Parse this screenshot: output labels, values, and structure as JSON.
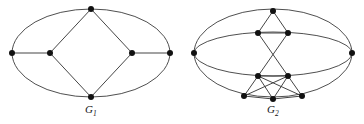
{
  "figure": {
    "background_color": "#ffffff",
    "edge_color": "#3b3b3b",
    "node_color": "#111111",
    "caption_color": "#141414"
  },
  "graphs": [
    {
      "id": "G1",
      "caption_main": "G",
      "caption_sub": "1",
      "caption_full": "G1",
      "node_count": 6,
      "edge_count": 8,
      "outline": {
        "shape": "ellipse",
        "cx": 91,
        "cy": 53,
        "rx": 79,
        "ry": 45
      },
      "nodes": [
        {
          "name": "left-pole",
          "x": 12,
          "y": 53,
          "r": 3.0
        },
        {
          "name": "inner-left",
          "x": 50,
          "y": 53,
          "r": 3.0
        },
        {
          "name": "top",
          "x": 91,
          "y": 9,
          "r": 3.0
        },
        {
          "name": "bottom",
          "x": 91,
          "y": 97,
          "r": 3.0
        },
        {
          "name": "inner-right",
          "x": 132,
          "y": 53,
          "r": 3.0
        },
        {
          "name": "right-pole",
          "x": 170,
          "y": 53,
          "r": 3.0
        }
      ],
      "straight_edges": [
        {
          "from": "left-pole",
          "to": "inner-left"
        },
        {
          "from": "inner-left",
          "to": "top"
        },
        {
          "from": "inner-left",
          "to": "bottom"
        },
        {
          "from": "top",
          "to": "inner-right"
        },
        {
          "from": "bottom",
          "to": "inner-right"
        },
        {
          "from": "inner-right",
          "to": "right-pole"
        }
      ],
      "arc_edges": [
        {
          "from": "left-pole",
          "to": "right-pole",
          "via": "top-arc"
        },
        {
          "from": "left-pole",
          "to": "right-pole",
          "via": "bottom-arc"
        }
      ]
    },
    {
      "id": "G2",
      "caption_main": "G",
      "caption_sub": "2",
      "caption_full": "G2",
      "node_count": 9,
      "edge_count": 18,
      "outline": {
        "shape": "triple-ellipse",
        "cx": 91,
        "cy": 53,
        "rx": 79,
        "ry_outer": 45,
        "ry_middle": 22,
        "ry_inner": 22
      },
      "nodes": [
        {
          "name": "left-pole",
          "x": 12,
          "y": 53,
          "r": 3.0
        },
        {
          "name": "right-pole",
          "x": 170,
          "y": 53,
          "r": 3.0
        },
        {
          "name": "top",
          "x": 91,
          "y": 11,
          "r": 3.0
        },
        {
          "name": "upper-left",
          "x": 76,
          "y": 33,
          "r": 3.0
        },
        {
          "name": "upper-right",
          "x": 106,
          "y": 33,
          "r": 3.0
        },
        {
          "name": "lower-left",
          "x": 76,
          "y": 76,
          "r": 3.0
        },
        {
          "name": "lower-right",
          "x": 106,
          "y": 76,
          "r": 3.0
        },
        {
          "name": "bottom-left",
          "x": 62,
          "y": 96,
          "r": 3.0
        },
        {
          "name": "bottom-center",
          "x": 91,
          "y": 99,
          "r": 3.0
        },
        {
          "name": "bottom-right",
          "x": 120,
          "y": 96,
          "r": 3.0
        }
      ],
      "straight_edges": [
        {
          "from": "top",
          "to": "upper-left"
        },
        {
          "from": "top",
          "to": "upper-right"
        },
        {
          "from": "upper-left",
          "to": "upper-right"
        },
        {
          "from": "upper-left",
          "to": "lower-right"
        },
        {
          "from": "upper-right",
          "to": "lower-left"
        },
        {
          "from": "lower-left",
          "to": "lower-right"
        },
        {
          "from": "lower-left",
          "to": "bottom-left"
        },
        {
          "from": "lower-left",
          "to": "bottom-center"
        },
        {
          "from": "lower-left",
          "to": "bottom-right"
        },
        {
          "from": "lower-right",
          "to": "bottom-left"
        },
        {
          "from": "lower-right",
          "to": "bottom-center"
        },
        {
          "from": "lower-right",
          "to": "bottom-right"
        },
        {
          "from": "bottom-left",
          "to": "bottom-center"
        },
        {
          "from": "bottom-center",
          "to": "bottom-right"
        }
      ],
      "arc_edges": [
        {
          "from": "left-pole",
          "to": "right-pole",
          "via": "outer-top-arc"
        },
        {
          "from": "left-pole",
          "to": "right-pole",
          "via": "outer-bottom-arc"
        },
        {
          "from": "left-pole",
          "to": "right-pole",
          "via": "upper-inner-arc"
        },
        {
          "from": "left-pole",
          "to": "right-pole",
          "via": "lower-inner-arc"
        }
      ]
    }
  ]
}
